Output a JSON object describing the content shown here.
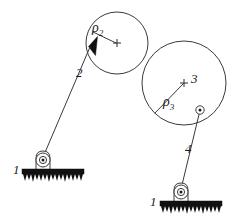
{
  "figure": {
    "type": "mechanism-kinematic-diagram",
    "background_color": "#ffffff",
    "line_color": "#3a3a3a",
    "fill_color": "#111111",
    "width": 236,
    "height": 217
  },
  "labels": {
    "ground_left": "1",
    "ground_right": "1",
    "link_two": "2",
    "link_four": "4",
    "body_three": "3",
    "radius_two_base": "ρ",
    "radius_two_sub": "2",
    "radius_three_base": "ρ",
    "radius_three_sub": "3"
  },
  "bodies": {
    "circle_two": {
      "name": "body-2-circle",
      "cx": 117,
      "cy": 43,
      "r": 31
    },
    "circle_three": {
      "name": "body-3-circle",
      "cx": 184,
      "cy": 83,
      "r": 42
    }
  },
  "joints": {
    "ground_pivot_left": {
      "cx": 43,
      "cy": 160,
      "label": "1"
    },
    "ground_pivot_right": {
      "cx": 181,
      "cy": 192,
      "label": "1"
    },
    "pin_on_circle_three": {
      "cx": 200,
      "cy": 110
    }
  },
  "links": {
    "link_two_from": {
      "x": 89,
      "y": 47
    },
    "link_two_to": {
      "x": 43,
      "y": 156
    },
    "link_four_from": {
      "x": 200,
      "y": 112
    },
    "link_four_to": {
      "x": 181,
      "y": 188
    }
  },
  "radii": {
    "rho_two_from": {
      "x": 93,
      "y": 32
    },
    "rho_two_to": {
      "x": 117,
      "y": 43
    },
    "rho_three_from": {
      "x": 155,
      "y": 113
    },
    "rho_three_to": {
      "x": 184,
      "y": 83
    }
  }
}
